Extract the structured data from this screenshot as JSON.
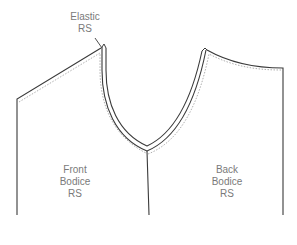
{
  "labels": {
    "elastic": {
      "line1": "Elastic",
      "line2": "RS"
    },
    "front_bodice": {
      "line1": "Front",
      "line2": "Bodice",
      "line3": "RS"
    },
    "back_bodice": {
      "line1": "Back",
      "line2": "Bodice",
      "line3": "RS"
    }
  },
  "colors": {
    "outline": "#3a3a3a",
    "stitch": "#9a9a9a",
    "label_text": "#7a7a7a",
    "background": "#ffffff"
  }
}
